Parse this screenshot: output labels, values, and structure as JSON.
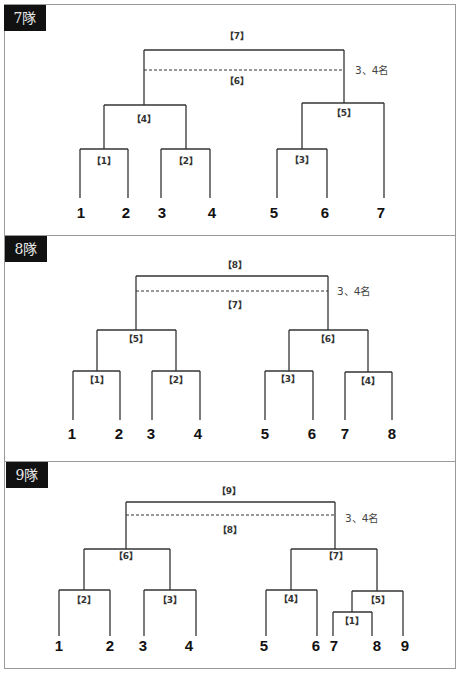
{
  "sections": [
    {
      "label": "7隊",
      "teams": [
        "1",
        "2",
        "3",
        "4",
        "5",
        "6",
        "7"
      ],
      "matches": {
        "m1": "【1】",
        "m2": "【2】",
        "m3": "【3】",
        "m4": "【4】",
        "m5": "【5】",
        "m6": "【6】",
        "m7": "【7】"
      },
      "third_place_label": "3、4名"
    },
    {
      "label": "8隊",
      "teams": [
        "1",
        "2",
        "3",
        "4",
        "5",
        "6",
        "7",
        "8"
      ],
      "matches": {
        "m1": "【1】",
        "m2": "【2】",
        "m3": "【3】",
        "m4": "【4】",
        "m5": "【5】",
        "m6": "【6】",
        "m7": "【7】",
        "m8": "【8】"
      },
      "third_place_label": "3、4名"
    },
    {
      "label": "9隊",
      "teams": [
        "1",
        "2",
        "3",
        "4",
        "5",
        "6",
        "7",
        "8",
        "9"
      ],
      "matches": {
        "m1": "【1】",
        "m2": "【2】",
        "m3": "【3】",
        "m4": "【4】",
        "m5": "【5】",
        "m6": "【6】",
        "m7": "【7】",
        "m8": "【8】",
        "m9": "【9】"
      },
      "third_place_label": "3、4名"
    }
  ]
}
